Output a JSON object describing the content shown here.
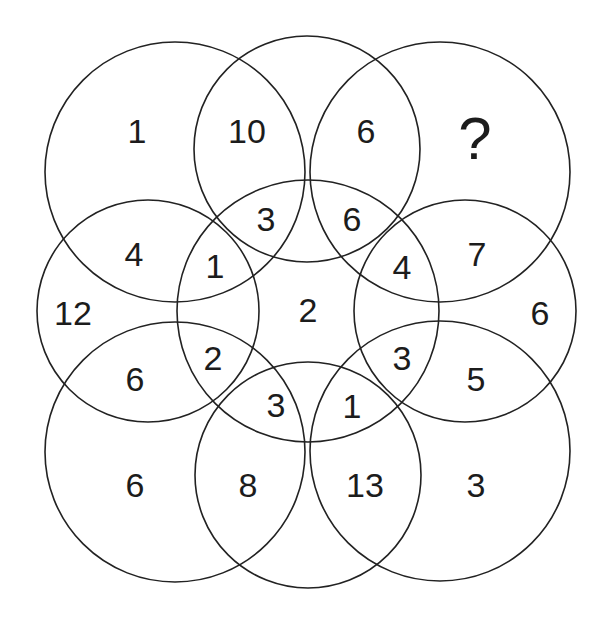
{
  "puzzle": {
    "description": "Nine overlapping circles with numbers in regions; find the missing number",
    "circles": [
      {
        "id": "center",
        "cx": 308,
        "cy": 311,
        "r": 131
      },
      {
        "id": "top",
        "cx": 307,
        "cy": 149,
        "r": 113
      },
      {
        "id": "bottom",
        "cx": 308,
        "cy": 475,
        "r": 113
      },
      {
        "id": "left",
        "cx": 148,
        "cy": 311,
        "r": 111
      },
      {
        "id": "right",
        "cx": 465,
        "cy": 311,
        "r": 111
      },
      {
        "id": "top-left",
        "cx": 175,
        "cy": 172,
        "r": 130
      },
      {
        "id": "top-right",
        "cx": 440,
        "cy": 172,
        "r": 130
      },
      {
        "id": "bottom-left",
        "cx": 175,
        "cy": 452,
        "r": 130
      },
      {
        "id": "bottom-right",
        "cx": 440,
        "cy": 451,
        "r": 130
      }
    ],
    "labels": [
      {
        "id": "tl-outer",
        "text": "1",
        "x": 137,
        "y": 131
      },
      {
        "id": "top-left-ov",
        "text": "10",
        "x": 247,
        "y": 131
      },
      {
        "id": "top-right-ov",
        "text": "6",
        "x": 366,
        "y": 131
      },
      {
        "id": "tr-outer",
        "text": "?",
        "x": 475,
        "y": 138,
        "big": true
      },
      {
        "id": "tl-left-ov",
        "text": "4",
        "x": 134,
        "y": 254
      },
      {
        "id": "center-top-l",
        "text": "3",
        "x": 266,
        "y": 219
      },
      {
        "id": "center-top-r",
        "text": "6",
        "x": 352,
        "y": 219
      },
      {
        "id": "tr-right-ov",
        "text": "7",
        "x": 477,
        "y": 254
      },
      {
        "id": "center-left-t",
        "text": "1",
        "x": 215,
        "y": 266
      },
      {
        "id": "center-right-t",
        "text": "4",
        "x": 402,
        "y": 267
      },
      {
        "id": "left-outer",
        "text": "12",
        "x": 73,
        "y": 313
      },
      {
        "id": "center",
        "text": "2",
        "x": 308,
        "y": 310
      },
      {
        "id": "right-outer",
        "text": "6",
        "x": 540,
        "y": 313
      },
      {
        "id": "center-left-b",
        "text": "2",
        "x": 213,
        "y": 358
      },
      {
        "id": "center-right-b",
        "text": "3",
        "x": 402,
        "y": 358
      },
      {
        "id": "bl-left-ov",
        "text": "6",
        "x": 135,
        "y": 379
      },
      {
        "id": "br-right-ov",
        "text": "5",
        "x": 476,
        "y": 379
      },
      {
        "id": "center-bot-l",
        "text": "3",
        "x": 276,
        "y": 405
      },
      {
        "id": "center-bot-r",
        "text": "1",
        "x": 352,
        "y": 406
      },
      {
        "id": "bl-outer",
        "text": "6",
        "x": 135,
        "y": 485
      },
      {
        "id": "bottom-left-ov",
        "text": "8",
        "x": 248,
        "y": 485
      },
      {
        "id": "bottom-right-ov",
        "text": "13",
        "x": 365,
        "y": 485
      },
      {
        "id": "br-outer",
        "text": "3",
        "x": 476,
        "y": 485
      }
    ],
    "stroke_color": "#222222",
    "text_color": "#1c1c1c",
    "background": "#ffffff"
  }
}
